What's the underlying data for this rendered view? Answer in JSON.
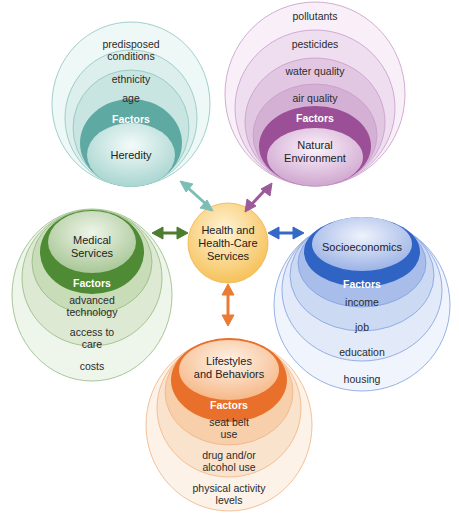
{
  "center": {
    "label": "Health and\nHealth-Care\nServices",
    "color": "#f6c25a"
  },
  "clusters": [
    {
      "id": "heredity",
      "core": "Heredity",
      "factors_label": "Factors",
      "items": [
        "age",
        "ethnicity",
        "predisposed\nconditions"
      ],
      "color": "#5aa8a2",
      "light": "#d9eeec",
      "arrow": "#7dbdb8"
    },
    {
      "id": "natural-environment",
      "core": "Natural\nEnvironment",
      "factors_label": "Factors",
      "items": [
        "air quality",
        "water quality",
        "pesticides",
        "pollutants"
      ],
      "color": "#9a4f96",
      "light": "#efdcef",
      "arrow": "#9b5a9a"
    },
    {
      "id": "medical-services",
      "core": "Medical\nServices",
      "factors_label": "Factors",
      "items": [
        "advanced\ntechnology",
        "access to\ncare",
        "costs"
      ],
      "color": "#4f8a34",
      "light": "#dce9d2",
      "arrow": "#4e7d32"
    },
    {
      "id": "socioeconomics",
      "core": "Socioeconomics",
      "factors_label": "Factors",
      "items": [
        "income",
        "job",
        "education",
        "housing"
      ],
      "color": "#2f63c4",
      "light": "#d7e1f6",
      "arrow": "#3569c8"
    },
    {
      "id": "lifestyles",
      "core": "Lifestyles\nand Behaviors",
      "factors_label": "Factors",
      "items": [
        "seat belt\nuse",
        "drug and/or\nalcohol use",
        "physical activity\nlevels"
      ],
      "color": "#e8702a",
      "light": "#fbe5d2",
      "arrow": "#ea7a34"
    }
  ]
}
